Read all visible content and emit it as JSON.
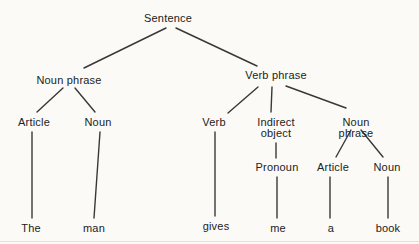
{
  "figure": {
    "type": "syntax-tree-diagram",
    "background_color": "#fbfaf7",
    "line_color": "#383838",
    "text_color": "#222222"
  },
  "tree": {
    "nodes": {
      "sentence": {
        "label": "Sentence"
      },
      "noun_phrase_left": {
        "label": "Noun phrase"
      },
      "verb_phrase": {
        "label": "Verb phrase"
      },
      "article_left": {
        "label": "Article"
      },
      "noun_left": {
        "label": "Noun"
      },
      "verb": {
        "label": "Verb"
      },
      "indirect_object": {
        "label": "Indirect\nobject"
      },
      "noun_phrase_right": {
        "label": "Noun phrase"
      },
      "pronoun": {
        "label": "Pronoun"
      },
      "article_right": {
        "label": "Article"
      },
      "noun_right": {
        "label": "Noun"
      },
      "word_the": {
        "label": "The"
      },
      "word_man": {
        "label": "man"
      },
      "word_gives": {
        "label": "gives"
      },
      "word_me": {
        "label": "me"
      },
      "word_a": {
        "label": "a"
      },
      "word_book": {
        "label": "book"
      }
    },
    "edges": [
      [
        "sentence",
        "noun_phrase_left"
      ],
      [
        "sentence",
        "verb_phrase"
      ],
      [
        "noun_phrase_left",
        "article_left"
      ],
      [
        "noun_phrase_left",
        "noun_left"
      ],
      [
        "article_left",
        "word_the"
      ],
      [
        "noun_left",
        "word_man"
      ],
      [
        "verb_phrase",
        "verb"
      ],
      [
        "verb_phrase",
        "indirect_object"
      ],
      [
        "verb_phrase",
        "noun_phrase_right"
      ],
      [
        "verb",
        "word_gives"
      ],
      [
        "indirect_object",
        "pronoun"
      ],
      [
        "pronoun",
        "word_me"
      ],
      [
        "noun_phrase_right",
        "article_right"
      ],
      [
        "noun_phrase_right",
        "noun_right"
      ],
      [
        "article_right",
        "word_a"
      ],
      [
        "noun_right",
        "word_book"
      ]
    ]
  }
}
